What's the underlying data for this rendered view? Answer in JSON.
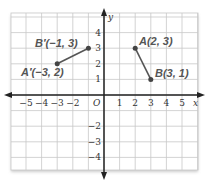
{
  "diagram": {
    "type": "coordinate-plane",
    "x_axis_label": "x",
    "y_axis_label": "y",
    "origin_label": "O",
    "x_ticks": [
      "−5",
      "−4",
      "−3",
      "−2",
      "1",
      "2",
      "3",
      "4",
      "5"
    ],
    "x_tick_values": [
      -5,
      -4,
      -3,
      -2,
      1,
      2,
      3,
      4,
      5
    ],
    "y_ticks": [
      "4",
      "3",
      "2",
      "1",
      "−2",
      "−3",
      "−4"
    ],
    "y_tick_values": [
      4,
      3,
      2,
      1,
      -2,
      -3,
      -4
    ],
    "segments": [
      {
        "name": "AB",
        "points": [
          {
            "label": "A(2, 3)",
            "x": 2,
            "y": 3
          },
          {
            "label": "B(3, 1)",
            "x": 3,
            "y": 1
          }
        ]
      },
      {
        "name": "A'B'",
        "points": [
          {
            "label": "A′(−3, 2)",
            "x": -3,
            "y": 2
          },
          {
            "label": "B′(−1, 3)",
            "x": -1,
            "y": 3
          }
        ]
      }
    ],
    "colors": {
      "grid": "#c8c8c8",
      "axis": "#222222",
      "segment": "#555555",
      "point": "#444444",
      "label": "#555555"
    }
  }
}
